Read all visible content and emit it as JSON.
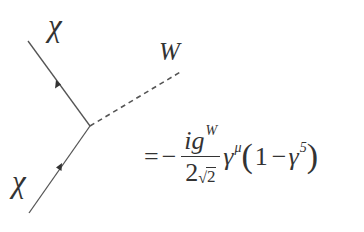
{
  "diagram": {
    "type": "feynman-vertex",
    "particles": {
      "incoming_top": {
        "label": "χ",
        "line": "fermion",
        "arrow": "toward-upper-left"
      },
      "incoming_bottom": {
        "label": "χ",
        "line": "fermion",
        "arrow": "toward-vertex"
      },
      "boson": {
        "label": "W",
        "line": "dashed"
      }
    },
    "geometry": {
      "vertex": [
        90,
        126
      ],
      "upper_line_end": [
        28,
        41
      ],
      "lower_line_end": [
        29,
        213
      ],
      "dashed_line_end": [
        182,
        71
      ]
    },
    "line_color": "#555555"
  },
  "labels": {
    "chi_top": "χ",
    "chi_bottom": "χ",
    "w_boson": "W"
  },
  "formula": {
    "equals": "=",
    "minus": "−",
    "numerator": "ig",
    "numerator_sup": "W",
    "denominator_coeff": "2",
    "denominator_radical": "√",
    "denominator_radicand": "2",
    "gamma": "γ",
    "gamma_sup": "μ",
    "open_paren": "(",
    "one": "1",
    "inner_minus": "−",
    "gamma5": "γ",
    "gamma5_sup": "5",
    "close_paren": ")"
  }
}
